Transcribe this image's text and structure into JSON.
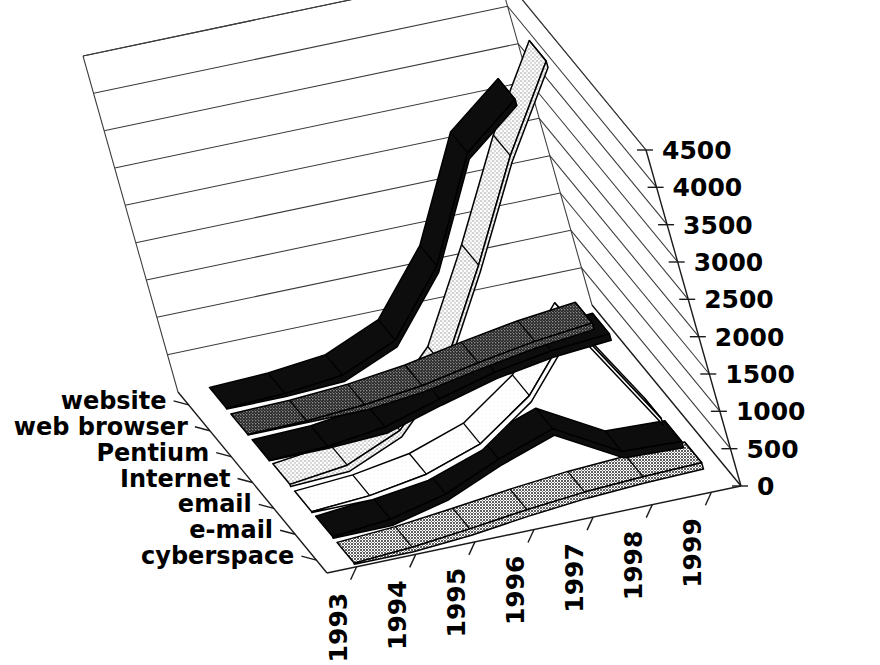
{
  "chart_data": {
    "type": "area",
    "render": "3d-ribbon-surface",
    "title": "",
    "subtitle": "",
    "xlabel": "",
    "ylabel": "",
    "zlabel": "",
    "grid": true,
    "legend_position": "none",
    "x": [
      "1993",
      "1994",
      "1995",
      "1996",
      "1997",
      "1998",
      "1999"
    ],
    "categories": [
      "1993",
      "1994",
      "1995",
      "1996",
      "1997",
      "1998",
      "1999"
    ],
    "series_axis_labels": [
      "website",
      "web browser",
      "Pentium",
      "Internet",
      "email",
      "e-mail",
      "cyberspace"
    ],
    "ylim": [
      0,
      4500
    ],
    "yticks": [
      0,
      500,
      1000,
      1500,
      2000,
      2500,
      3000,
      3500,
      4000,
      4500
    ],
    "ytick_labels": [
      "0",
      "500",
      "1000",
      "1500",
      "2000",
      "2500",
      "3000",
      "3500",
      "4000",
      "4500"
    ],
    "series": [
      {
        "name": "website",
        "fill": "black",
        "color": "#111111",
        "values": [
          10,
          40,
          120,
          420,
          1250,
          2600,
          3150
        ]
      },
      {
        "name": "web browser",
        "fill": "dark-gray",
        "color": "#4a4a4a",
        "values": [
          5,
          20,
          70,
          160,
          300,
          420,
          500
        ]
      },
      {
        "name": "Pentium",
        "fill": "black",
        "color": "#111111",
        "values": [
          5,
          25,
          120,
          330,
          520,
          640,
          700
        ]
      },
      {
        "name": "Internet",
        "fill": "light-speckle",
        "color": "#e2e2e2",
        "values": [
          30,
          120,
          420,
          1100,
          2300,
          3600,
          4700
        ]
      },
      {
        "name": "email",
        "fill": "white",
        "color": "#f4f4f4",
        "values": [
          10,
          60,
          180,
          420,
          900,
          1700,
          260
        ]
      },
      {
        "name": "e-mail",
        "fill": "black",
        "color": "#111111",
        "values": [
          20,
          90,
          260,
          560,
          800,
          330,
          300
        ]
      },
      {
        "name": "cyberspace",
        "fill": "medium-gray",
        "color": "#6b6b6b",
        "values": [
          15,
          60,
          140,
          230,
          300,
          340,
          360
        ]
      }
    ]
  },
  "axes": {
    "y_axis_name": "value-axis",
    "x_axis_name": "year-axis",
    "z_axis_name": "term-axis"
  }
}
